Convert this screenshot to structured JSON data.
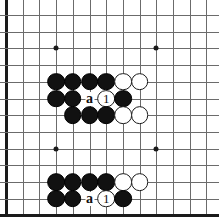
{
  "diagram": {
    "type": "go-board-diagram",
    "game": "Go",
    "board_crop": {
      "columns": 13,
      "rows": 13,
      "cell_size": 16.7,
      "origin_x": 6,
      "origin_y": 15,
      "left_edge_is_board_edge": true,
      "bottom_edge_is_board_edge": true,
      "top_edge_is_board_edge": false,
      "right_edge_is_board_edge": false
    },
    "colors": {
      "background": "#ffffff",
      "grid_line": "#6b6b6b",
      "edge_line": "#1a1a1a",
      "black_stone": "#111111",
      "white_stone": "#ffffff",
      "white_stone_border": "#1a1a1a",
      "label_text": "#111111"
    },
    "star_points": [
      {
        "col": 3,
        "row": 2
      },
      {
        "col": 9,
        "row": 2
      },
      {
        "col": 3,
        "row": 8
      },
      {
        "col": 9,
        "row": 8
      }
    ],
    "stones": [
      {
        "col": 3,
        "row": 4,
        "color": "black"
      },
      {
        "col": 4,
        "row": 4,
        "color": "black"
      },
      {
        "col": 5,
        "row": 4,
        "color": "black"
      },
      {
        "col": 6,
        "row": 4,
        "color": "black"
      },
      {
        "col": 7,
        "row": 4,
        "color": "white"
      },
      {
        "col": 8,
        "row": 4,
        "color": "white"
      },
      {
        "col": 3,
        "row": 5,
        "color": "black"
      },
      {
        "col": 4,
        "row": 5,
        "color": "black"
      },
      {
        "col": 6,
        "row": 5,
        "color": "white",
        "number": "1"
      },
      {
        "col": 7,
        "row": 5,
        "color": "black"
      },
      {
        "col": 4,
        "row": 6,
        "color": "black"
      },
      {
        "col": 5,
        "row": 6,
        "color": "black"
      },
      {
        "col": 6,
        "row": 6,
        "color": "black"
      },
      {
        "col": 7,
        "row": 6,
        "color": "white"
      },
      {
        "col": 8,
        "row": 6,
        "color": "white"
      },
      {
        "col": 3,
        "row": 10,
        "color": "black"
      },
      {
        "col": 4,
        "row": 10,
        "color": "black"
      },
      {
        "col": 5,
        "row": 10,
        "color": "black"
      },
      {
        "col": 6,
        "row": 10,
        "color": "black"
      },
      {
        "col": 7,
        "row": 10,
        "color": "white"
      },
      {
        "col": 8,
        "row": 10,
        "color": "white"
      },
      {
        "col": 3,
        "row": 11,
        "color": "black"
      },
      {
        "col": 4,
        "row": 11,
        "color": "black"
      },
      {
        "col": 6,
        "row": 11,
        "color": "white",
        "number": "1"
      },
      {
        "col": 7,
        "row": 11,
        "color": "black"
      }
    ],
    "point_labels": [
      {
        "col": 5,
        "row": 5,
        "text": "a"
      },
      {
        "col": 5,
        "row": 11,
        "text": "a"
      }
    ]
  }
}
